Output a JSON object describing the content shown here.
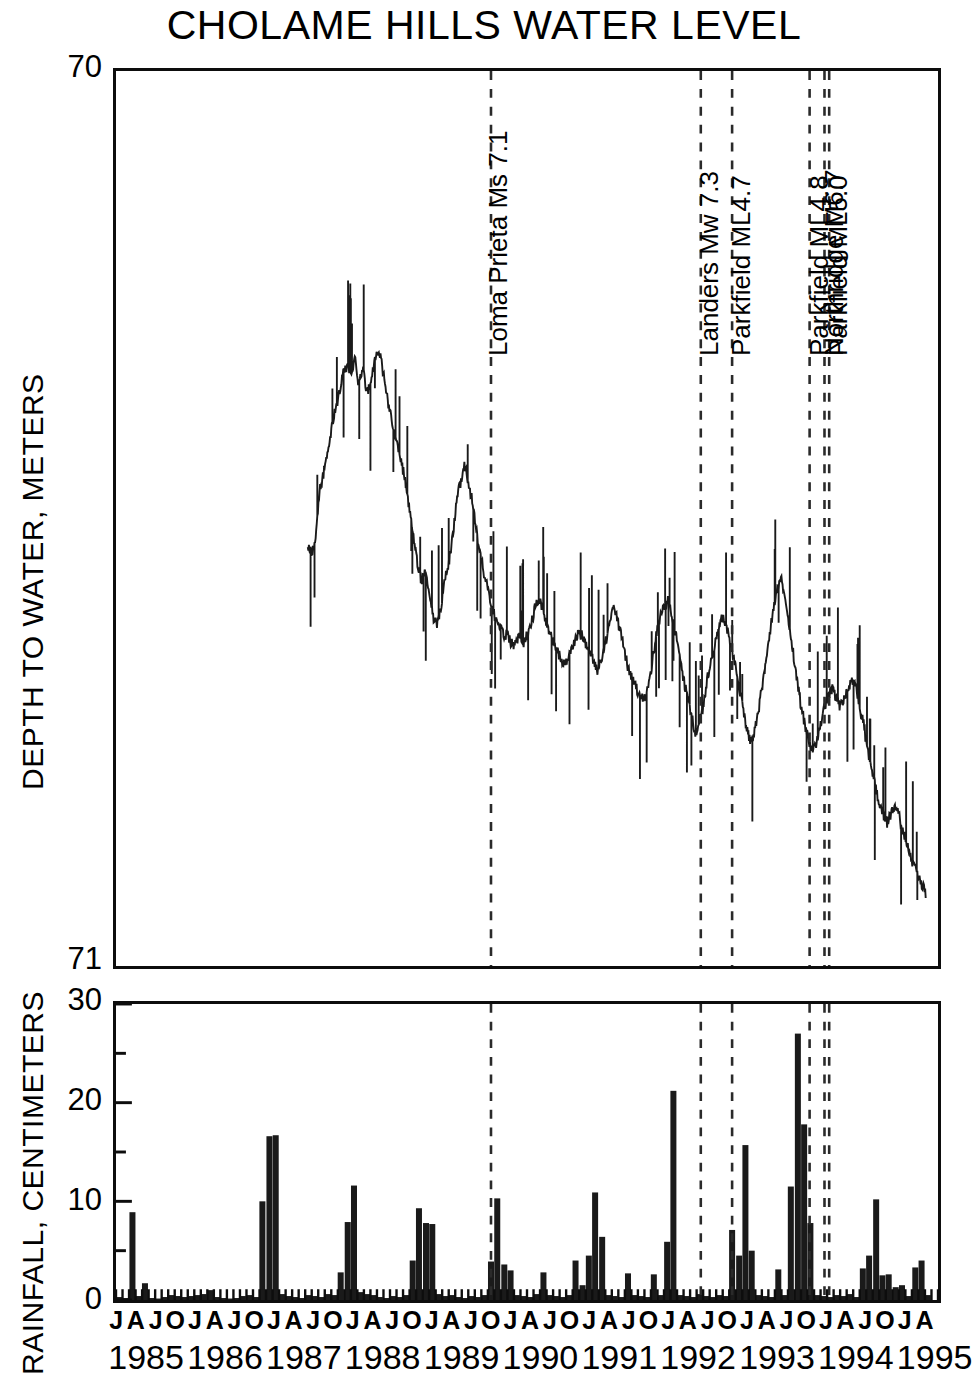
{
  "chart_data": {
    "type": "line",
    "title": "CHOLAME HILLS WATER LEVEL",
    "panels": [
      {
        "id": "water-level",
        "type": "line",
        "ylabel": "DEPTH TO WATER, METERS",
        "ylim": [
          71,
          70
        ],
        "ytick_labels": [
          "70",
          "71"
        ],
        "ytick_values": [
          70,
          71
        ],
        "y_axis_inverted": true,
        "grid": false,
        "xlim": [
          1985.0,
          1995.5
        ],
        "series": [
          {
            "name": "Depth to water",
            "color": "#1a1a1a",
            "x": [
              1987.45,
              1987.5,
              1987.55,
              1987.6,
              1987.65,
              1987.7,
              1987.75,
              1987.8,
              1987.85,
              1987.9,
              1987.95,
              1988.0,
              1988.05,
              1988.1,
              1988.15,
              1988.2,
              1988.25,
              1988.3,
              1988.35,
              1988.4,
              1988.45,
              1988.5,
              1988.55,
              1988.6,
              1988.65,
              1988.7,
              1988.75,
              1988.8,
              1988.85,
              1988.9,
              1988.95,
              1989.0,
              1989.05,
              1989.1,
              1989.15,
              1989.2,
              1989.25,
              1989.3,
              1989.35,
              1989.4,
              1989.45,
              1989.5,
              1989.55,
              1989.6,
              1989.65,
              1989.7,
              1989.75,
              1989.8,
              1989.85,
              1989.9,
              1989.95,
              1990.0,
              1990.05,
              1990.1,
              1990.15,
              1990.2,
              1990.25,
              1990.3,
              1990.35,
              1990.4,
              1990.45,
              1990.5,
              1990.55,
              1990.6,
              1990.65,
              1990.7,
              1990.75,
              1990.8,
              1990.85,
              1990.9,
              1990.95,
              1991.0,
              1991.05,
              1991.1,
              1991.15,
              1991.2,
              1991.25,
              1991.3,
              1991.35,
              1991.4,
              1991.45,
              1991.5,
              1991.55,
              1991.6,
              1991.65,
              1991.7,
              1991.75,
              1991.8,
              1991.85,
              1991.9,
              1991.95,
              1992.0,
              1992.05,
              1992.1,
              1992.15,
              1992.2,
              1992.25,
              1992.3,
              1992.35,
              1992.4,
              1992.45,
              1992.5,
              1992.55,
              1992.6,
              1992.65,
              1992.7,
              1992.75,
              1992.8,
              1992.85,
              1992.9,
              1992.95,
              1993.0,
              1993.05,
              1993.1,
              1993.15,
              1993.2,
              1993.25,
              1993.3,
              1993.35,
              1993.4,
              1993.45,
              1993.5,
              1993.55,
              1993.6,
              1993.65,
              1993.7,
              1993.75,
              1993.8,
              1993.85,
              1993.9,
              1993.95,
              1994.0,
              1994.05,
              1994.1,
              1994.15,
              1994.2,
              1994.25,
              1994.3,
              1994.35,
              1994.4,
              1994.45,
              1994.5,
              1994.55,
              1994.6,
              1994.65,
              1994.7,
              1994.75,
              1994.8,
              1994.85,
              1994.9,
              1994.95,
              1995.0,
              1995.05,
              1995.1,
              1995.15,
              1995.2,
              1995.25,
              1995.3,
              1995.35
            ],
            "y": [
              70.53,
              70.54,
              70.52,
              70.47,
              70.45,
              70.43,
              70.4,
              70.38,
              70.36,
              70.34,
              70.33,
              70.34,
              70.32,
              70.35,
              70.33,
              70.36,
              70.35,
              70.32,
              70.31,
              70.33,
              70.36,
              70.38,
              70.4,
              70.42,
              70.44,
              70.46,
              70.49,
              70.52,
              70.55,
              70.57,
              70.56,
              70.58,
              70.61,
              70.62,
              70.6,
              70.57,
              70.55,
              70.52,
              70.48,
              70.46,
              70.44,
              70.46,
              70.48,
              70.51,
              70.54,
              70.56,
              70.58,
              70.6,
              70.61,
              70.62,
              70.63,
              70.63,
              70.64,
              70.64,
              70.63,
              70.64,
              70.63,
              70.62,
              70.6,
              70.59,
              70.6,
              70.62,
              70.63,
              70.64,
              70.65,
              70.66,
              70.66,
              70.65,
              70.64,
              70.63,
              70.63,
              70.64,
              70.65,
              70.66,
              70.67,
              70.66,
              70.64,
              70.62,
              70.6,
              70.61,
              70.63,
              70.65,
              70.67,
              70.68,
              70.69,
              70.7,
              70.7,
              70.69,
              70.66,
              70.63,
              70.61,
              70.6,
              70.59,
              70.61,
              70.63,
              70.65,
              70.68,
              70.7,
              70.72,
              70.74,
              70.73,
              70.71,
              70.68,
              70.66,
              70.64,
              70.62,
              70.61,
              70.62,
              70.64,
              70.66,
              70.68,
              70.71,
              70.73,
              70.75,
              70.74,
              70.72,
              70.69,
              70.66,
              70.63,
              70.6,
              70.58,
              70.57,
              70.59,
              70.62,
              70.65,
              70.68,
              70.71,
              70.73,
              70.75,
              70.76,
              70.75,
              70.73,
              70.71,
              70.7,
              70.69,
              70.7,
              70.71,
              70.7,
              70.69,
              70.68,
              70.69,
              70.71,
              70.73,
              70.76,
              70.78,
              70.8,
              70.82,
              70.83,
              70.84,
              70.83,
              70.82,
              70.83,
              70.85,
              70.86,
              70.88,
              70.89,
              70.9,
              70.91,
              70.92
            ]
          }
        ]
      },
      {
        "id": "rainfall",
        "type": "bar",
        "ylabel": "RAINFALL, CENTIMETERS",
        "ylim": [
          0,
          30
        ],
        "ytick_labels": [
          "0",
          "10",
          "20",
          "30"
        ],
        "ytick_values": [
          0,
          10,
          20,
          30
        ],
        "yminor_values": [
          5,
          15,
          25
        ],
        "grid": false,
        "xlim": [
          1985.0,
          1995.5
        ],
        "bar_color": "#1a1a1a",
        "series": [
          {
            "name": "Monthly rainfall",
            "x": [
              1985.04,
              1985.12,
              1985.21,
              1985.29,
              1985.37,
              1985.46,
              1985.54,
              1985.62,
              1985.71,
              1985.79,
              1985.87,
              1985.96,
              1986.04,
              1986.12,
              1986.21,
              1986.29,
              1986.37,
              1986.46,
              1986.54,
              1986.62,
              1986.71,
              1986.79,
              1986.87,
              1986.96,
              1987.04,
              1987.12,
              1987.21,
              1987.29,
              1987.37,
              1987.46,
              1987.54,
              1987.62,
              1987.71,
              1987.79,
              1987.87,
              1987.96,
              1988.04,
              1988.12,
              1988.21,
              1988.29,
              1988.37,
              1988.46,
              1988.54,
              1988.62,
              1988.71,
              1988.79,
              1988.87,
              1988.96,
              1989.04,
              1989.12,
              1989.21,
              1989.29,
              1989.37,
              1989.46,
              1989.54,
              1989.62,
              1989.71,
              1989.79,
              1989.87,
              1989.96,
              1990.04,
              1990.12,
              1990.21,
              1990.29,
              1990.37,
              1990.46,
              1990.54,
              1990.62,
              1990.71,
              1990.79,
              1990.87,
              1990.96,
              1991.04,
              1991.12,
              1991.21,
              1991.29,
              1991.37,
              1991.46,
              1991.54,
              1991.62,
              1991.71,
              1991.79,
              1991.87,
              1991.96,
              1992.04,
              1992.12,
              1992.21,
              1992.29,
              1992.37,
              1992.46,
              1992.54,
              1992.62,
              1992.71,
              1992.79,
              1992.87,
              1992.96,
              1993.04,
              1993.12,
              1993.21,
              1993.29,
              1993.37,
              1993.46,
              1993.54,
              1993.62,
              1993.71,
              1993.79,
              1993.87,
              1993.96,
              1994.04,
              1994.12,
              1994.21,
              1994.29,
              1994.37,
              1994.46,
              1994.54,
              1994.62,
              1994.71,
              1994.79,
              1994.87,
              1994.96,
              1995.04,
              1995.12,
              1995.21,
              1995.29,
              1995.37
            ],
            "values": [
              0.3,
              0.2,
              8.9,
              0.4,
              1.7,
              0.2,
              0.0,
              0.3,
              0.5,
              0.4,
              0.3,
              0.4,
              0.5,
              0.6,
              1.0,
              0.3,
              0.2,
              0.1,
              0.2,
              0.4,
              0.5,
              0.3,
              10.0,
              16.6,
              16.7,
              0.6,
              0.4,
              0.3,
              0.2,
              0.5,
              0.4,
              0.3,
              0.6,
              0.5,
              2.8,
              7.9,
              11.6,
              0.8,
              0.6,
              0.5,
              0.3,
              0.2,
              0.4,
              0.3,
              0.5,
              4.0,
              9.3,
              7.8,
              7.7,
              0.6,
              0.4,
              0.5,
              0.3,
              0.2,
              0.4,
              0.3,
              0.5,
              3.9,
              10.3,
              3.6,
              3.0,
              0.5,
              0.4,
              0.3,
              0.6,
              2.8,
              0.5,
              0.4,
              0.3,
              0.5,
              4.0,
              1.5,
              4.5,
              10.9,
              6.4,
              0.5,
              0.4,
              0.3,
              2.7,
              0.5,
              0.4,
              0.3,
              2.6,
              0.5,
              5.9,
              21.2,
              0.5,
              0.4,
              0.3,
              0.6,
              0.4,
              0.3,
              0.5,
              0.4,
              7.1,
              4.5,
              15.7,
              5.0,
              0.5,
              0.4,
              0.3,
              3.1,
              0.5,
              11.5,
              27.0,
              17.8,
              7.8,
              0.5,
              0.4,
              0.3,
              0.5,
              0.4,
              0.6,
              0.3,
              3.2,
              4.5,
              10.2,
              2.5,
              2.6,
              1.3,
              1.5,
              0.4,
              3.3,
              4.0,
              0.5
            ]
          }
        ]
      }
    ],
    "events": [
      {
        "label": "Loma Prieta Ms 7.1",
        "x": 1989.79
      },
      {
        "label": "Landers Mw 7.3",
        "x": 1992.47
      },
      {
        "label": "Parkfield ML4.7",
        "x": 1992.87
      },
      {
        "label": "Parkfield ML4.8",
        "x": 1993.86
      },
      {
        "label": "Northridge M6.7",
        "x": 1994.05
      },
      {
        "label": "Parkfield ML5.0",
        "x": 1994.11
      }
    ],
    "xaxis": {
      "month_labels": [
        "J",
        "A",
        "J",
        "O"
      ],
      "month_values": [
        0.04,
        0.29,
        0.54,
        0.79
      ],
      "years": [
        "1985",
        "1986",
        "1987",
        "1988",
        "1989",
        "1990",
        "1991",
        "1992",
        "1993",
        "1994",
        "1995"
      ],
      "year_values": [
        1985,
        1986,
        1987,
        1988,
        1989,
        1990,
        1991,
        1992,
        1993,
        1994,
        1995
      ]
    },
    "colors": {
      "line": "#1a1a1a",
      "bar": "#1a1a1a",
      "axis": "#0d0d0d",
      "event_line": "#2a2a2a",
      "background": "#ffffff"
    }
  },
  "figure": {
    "title": "CHOLAME HILLS WATER LEVEL",
    "water_panel": {
      "y_title": "DEPTH TO WATER, METERS",
      "tick_top": "70",
      "tick_bottom": "71"
    },
    "rainfall_panel": {
      "y_title": "RAINFALL, CENTIMETERS",
      "tick_30": "30",
      "tick_20": "20",
      "tick_10": "10",
      "tick_0": "0"
    },
    "events": {
      "e0": "Loma Prieta Ms 7.1",
      "e1": "Landers Mw 7.3",
      "e2": "Parkfield ML4.7",
      "e3": "Parkfield ML4.8",
      "e4": "Northridge M6.7",
      "e5": "Parkfield ML5.0"
    }
  }
}
